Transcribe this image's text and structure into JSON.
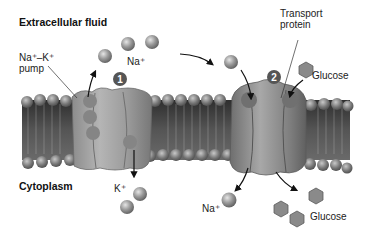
{
  "diagram": {
    "regions": {
      "top": "Extracellular fluid",
      "bottom": "Cytoplasm"
    },
    "labels": {
      "pump": "Na⁺–K⁺",
      "pump_line2": "pump",
      "transport_line1": "Transport",
      "transport_line2": "protein",
      "na_top": "Na⁺",
      "k_bottom": "K⁺",
      "na_bottom": "Na⁺",
      "glucose_top": "Glucose",
      "glucose_bottom": "Glucose"
    },
    "steps": [
      {
        "number": "1",
        "mechanism": "Na⁺–K⁺ pump"
      },
      {
        "number": "2",
        "mechanism": "Transport protein (Na⁺/glucose cotransport)"
      }
    ],
    "colors": {
      "membrane_head": "#7a7a7a",
      "membrane_core": "#4a4a4a",
      "protein": "#9a9a9a",
      "ion": "#a8a8a8",
      "badge": "#555555"
    }
  }
}
